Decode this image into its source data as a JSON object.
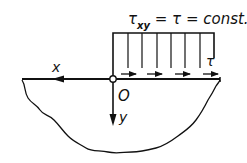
{
  "diagram": {
    "title": {
      "tau": "τ",
      "subscript": "xy",
      "rest": " = τ = const."
    },
    "labels": {
      "x_axis": "x",
      "y_axis": "y",
      "origin": "O",
      "tau": "τ"
    },
    "load": {
      "type": "uniform shear stress",
      "arrow_count": 4
    },
    "colors": {
      "ink": "#111111",
      "background": "#ffffff"
    }
  }
}
